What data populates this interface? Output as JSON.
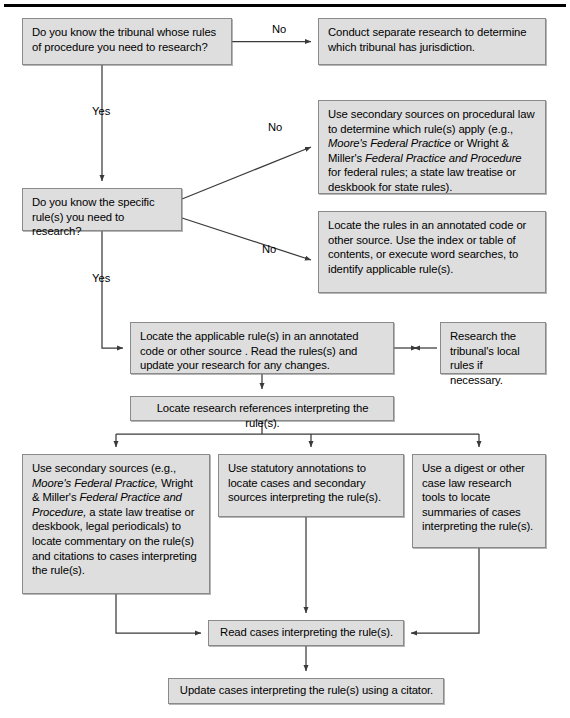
{
  "figure": {
    "type": "flowchart",
    "top_rule": true
  },
  "nodes": {
    "q1": {
      "id": "q1",
      "label": "Do you know the tribunal whose rules of procedure you need to research?",
      "x": 22,
      "y": 18,
      "w": 210,
      "h": 47
    },
    "n_jurisdiction": {
      "id": "n_jurisdiction",
      "label": "Conduct separate research to determine which tribunal has jurisdiction.",
      "x": 318,
      "y": 18,
      "w": 228,
      "h": 47
    },
    "q2": {
      "id": "q2",
      "label": "Do you know the specific rule(s) you need to research?",
      "x": 22,
      "y": 188,
      "w": 160,
      "h": 43
    },
    "n_secondary_sources": {
      "id": "n_secondary_sources",
      "label_runs": [
        {
          "t": "Use secondary sources on procedural law to determine which rule(s) apply (e.g., ",
          "i": false
        },
        {
          "t": "Moore's Federal Practice",
          "i": true
        },
        {
          "t": " or Wright & Miller's ",
          "i": false
        },
        {
          "t": "Federal Practice and Procedure",
          "i": true
        },
        {
          "t": " for federal rules; a state law treatise or deskbook for state rules).",
          "i": false
        }
      ],
      "x": 318,
      "y": 100,
      "w": 228,
      "h": 94
    },
    "n_locate_rules": {
      "id": "n_locate_rules",
      "label": "Locate the rules in an annotated code or other source. Use the index or table of contents, or execute word searches, to identify applicable rule(s).",
      "x": 318,
      "y": 211,
      "w": 228,
      "h": 82
    },
    "n_locate_applicable": {
      "id": "n_locate_applicable",
      "label": "Locate the applicable rule(s) in an annotated code or other source . Read the rules(s) and update your research for any changes.",
      "x": 130,
      "y": 322,
      "w": 264,
      "h": 52
    },
    "n_local_rules": {
      "id": "n_local_rules",
      "label": "Research the tribunal's local rules if necessary.",
      "x": 440,
      "y": 322,
      "w": 106,
      "h": 52
    },
    "n_locate_refs": {
      "id": "n_locate_refs",
      "label": "Locate research references interpreting the rule(s).",
      "x": 130,
      "y": 396,
      "w": 264,
      "h": 25
    },
    "n_col1": {
      "id": "n_col1",
      "label_runs": [
        {
          "t": "Use secondary sources (e.g., ",
          "i": false
        },
        {
          "t": "Moore's Federal Practice,",
          "i": true
        },
        {
          "t": " Wright & Miller's ",
          "i": false
        },
        {
          "t": "Federal Practice and Procedure,",
          "i": true
        },
        {
          "t": " a state law treatise or deskbook, legal periodicals) to locate commentary on the rule(s) and citations to cases interpreting the rule(s).",
          "i": false
        }
      ],
      "x": 22,
      "y": 454,
      "w": 188,
      "h": 140
    },
    "n_col2": {
      "id": "n_col2",
      "label": "Use statutory annotations to locate cases and secondary sources interpreting the rule(s).",
      "x": 218,
      "y": 454,
      "w": 186,
      "h": 63
    },
    "n_col3": {
      "id": "n_col3",
      "label": "Use a digest or other case law research tools to locate summaries of cases interpreting the rule(s).",
      "x": 412,
      "y": 454,
      "w": 134,
      "h": 94
    },
    "n_read_cases": {
      "id": "n_read_cases",
      "label": "Read cases interpreting the rule(s).",
      "x": 208,
      "y": 620,
      "w": 196,
      "h": 26
    },
    "n_update_cases": {
      "id": "n_update_cases",
      "label": "Update cases interpreting the rule(s) using a citator.",
      "x": 168,
      "y": 678,
      "w": 276,
      "h": 26
    }
  },
  "edge_labels": {
    "no_1": {
      "text": "No",
      "x": 272,
      "y": 23
    },
    "yes_1": {
      "text": "Yes",
      "x": 92,
      "y": 105
    },
    "no_2": {
      "text": "No",
      "x": 268,
      "y": 121
    },
    "no_3": {
      "text": "No",
      "x": 262,
      "y": 243
    },
    "yes_2": {
      "text": "Yes",
      "x": 92,
      "y": 272
    }
  },
  "colors": {
    "node_fill": "#dedede",
    "node_border": "#8a8a8a",
    "line": "#3a3a3a",
    "text": "#000000",
    "rule": "#000000"
  }
}
